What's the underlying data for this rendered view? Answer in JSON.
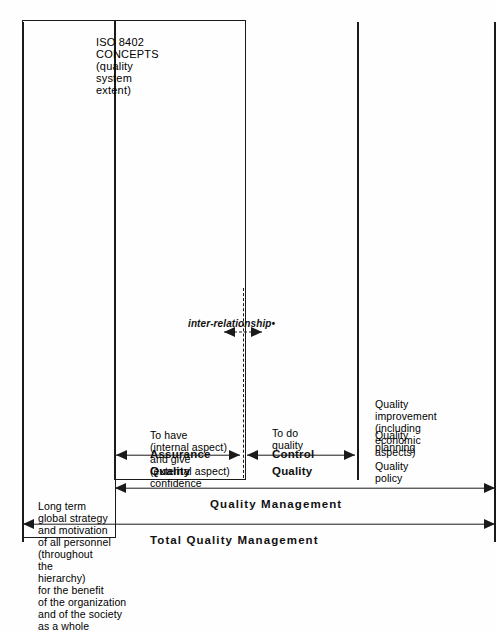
{
  "figure": {
    "type": "hierarchy-diagram",
    "orientation": "rotated-90-ccw",
    "ink_color": "#1a1a1a",
    "paper_color": "#fefefe"
  },
  "brackets": [
    {
      "id": "tqm",
      "label": "Total Quality Management",
      "scope": "outermost"
    },
    {
      "id": "qm",
      "label": "Quality Management",
      "scope": "inner"
    }
  ],
  "sections": [
    {
      "id": "tqm-content",
      "title": "",
      "lines": [
        "Long term",
        "global strategy",
        "and motivation",
        "of all personnel",
        "(throughout",
        "the",
        "hierarchy)",
        "for the benefit",
        "of the organization",
        "and  of the society",
        "as a whole"
      ]
    },
    {
      "id": "quality-assurance",
      "title_line1": "Quality",
      "title_line2": "Assurance",
      "lines": [
        "To have",
        "(internal aspect)",
        "and give",
        "(external aspect)",
        "confidence"
      ]
    },
    {
      "id": "quality-control",
      "title_line1": "Quality",
      "title_line2": "Control",
      "lines": [
        "To do",
        "quality"
      ]
    },
    {
      "id": "quality-management-concepts",
      "title_line1": "",
      "title_line2": "",
      "lines": [
        "Quality",
        "policy",
        "Quality",
        "planning",
        "Quality",
        "improvement",
        "(including",
        "economic",
        "aspects)"
      ],
      "groups": [
        [
          "Quality",
          "policy"
        ],
        [
          "Quality",
          "planning"
        ],
        [
          "Quality",
          "improvement",
          "(including",
          "economic",
          "aspects)"
        ]
      ]
    }
  ],
  "annotations": {
    "inter_relationship": "inter-relationship•"
  },
  "caption": {
    "lines": [
      "ISO 8402",
      "CONCEPTS",
      "(quality",
      "system",
      "extent)"
    ]
  }
}
